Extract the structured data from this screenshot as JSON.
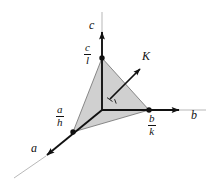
{
  "figure": {
    "background_color": "#ffffff",
    "plane_fill_color": "#d0d0d0",
    "line_color": "#111111",
    "thin_line_color": "#9a9a9a"
  },
  "axes": [
    {
      "name": "a-axis",
      "label": "a",
      "label_x": 31,
      "label_y": 148,
      "direction": "down-left"
    },
    {
      "name": "b-axis",
      "label": "b",
      "label_x": 191,
      "label_y": 115,
      "direction": "right"
    },
    {
      "name": "c-axis",
      "label": "c",
      "label_x": 89,
      "label_y": 25,
      "direction": "up"
    }
  ],
  "intercepts": [
    {
      "name": "a-intercept",
      "numerator": "a",
      "denominator": "h",
      "label_x": 56,
      "label_y": 111,
      "point_x": 73,
      "point_y": 132
    },
    {
      "name": "b-intercept",
      "numerator": "b",
      "denominator": "k",
      "label_x": 148,
      "label_y": 117,
      "point_x": 149,
      "point_y": 110
    },
    {
      "name": "c-intercept",
      "numerator": "c",
      "denominator": "l",
      "label_x": 84,
      "label_y": 49,
      "point_x": 102,
      "point_y": 58
    }
  ],
  "vectors": [
    {
      "name": "K-vector",
      "label": "K",
      "label_x": 142,
      "label_y": 56,
      "tail_x": 110,
      "tail_y": 99,
      "head_x": 139,
      "head_y": 70,
      "note": "reciprocal lattice vector normal to the plane"
    }
  ],
  "markers": [
    {
      "name": "right-angle-marker",
      "description": "perpendicularity tick where K meets the plane"
    }
  ],
  "origin": {
    "name": "origin",
    "x": 102,
    "y": 110
  },
  "plane": {
    "name": "lattice-plane",
    "vertices": [
      {
        "x": 102,
        "y": 58
      },
      {
        "x": 149,
        "y": 110
      },
      {
        "x": 73,
        "y": 132
      }
    ]
  }
}
